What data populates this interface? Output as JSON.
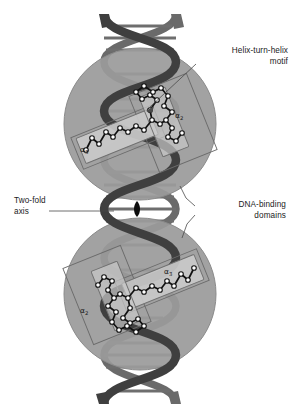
{
  "figure": {
    "background_color": "#ffffff",
    "width": 293,
    "height": 418
  },
  "palette": {
    "domain_circle_fill": "#9b9b9b",
    "domain_circle_stroke": "#8a8a8a",
    "dna_ribbon_fill": "#565656",
    "dna_ribbon_dark": "#3f3f3f",
    "dna_rung_fill": "#6e6e6e",
    "helix_box_fill": "#c9c9c9",
    "helix_box_stroke": "#707070",
    "domain_box_stroke": "#6b6b6b",
    "backbone_line": "#111111",
    "ca_atom_fill": "#ffffff",
    "ca_atom_stroke": "#111111",
    "axis_symbol_fill": "#0d0d0d",
    "label_text": "#1b1b1b",
    "leader_line": "#4a4a4a"
  },
  "labels": {
    "helix_turn_helix": "Helix-turn-helix\nmotif",
    "two_fold_axis": "Two-fold\naxis",
    "dna_binding_domains": "DNA-binding\ndomains"
  },
  "helix_labels": [
    {
      "id": "upper-alpha3",
      "text": "α",
      "subscript": "3",
      "x": 80,
      "y": 146
    },
    {
      "id": "upper-alpha2",
      "text": "α",
      "subscript": "2",
      "x": 175,
      "y": 112
    },
    {
      "id": "lower-alpha2",
      "text": "α",
      "subscript": "2",
      "x": 80,
      "y": 307
    },
    {
      "id": "lower-alpha3",
      "text": "α",
      "subscript": "3",
      "x": 164,
      "y": 268
    }
  ],
  "annotations": [
    {
      "name": "helix-turn-helix-leader",
      "from": {
        "x": 196,
        "y": 64
      },
      "to": {
        "x": 146,
        "y": 110
      },
      "arrow": true
    },
    {
      "name": "two-fold-axis-leader",
      "from": {
        "x": 49,
        "y": 211
      },
      "to": {
        "x": 112,
        "y": 211
      },
      "arrow": false
    },
    {
      "name": "dna-binding-domains-leader",
      "from": {
        "x": 195,
        "y": 206
      },
      "to": {
        "x": 178,
        "y": 188
      },
      "arrow": false
    },
    {
      "name": "dna-binding-domains-leader-lower",
      "from": {
        "x": 195,
        "y": 214
      },
      "to": {
        "x": 180,
        "y": 236
      },
      "arrow": false
    }
  ],
  "structure": {
    "dna": {
      "description": "Vertical B-form DNA double helix spanning the full figure height",
      "strand_count": 2,
      "axis_x": 140,
      "top_y": 14,
      "bottom_y": 404,
      "helical_period_px": 97,
      "base_pair_rungs": 22
    },
    "domains": [
      {
        "name": "upper-dna-binding-domain",
        "center": {
          "x": 140,
          "y": 124
        },
        "radius": 76,
        "helix_boxes": [
          {
            "label": "α3",
            "cx": 112,
            "cy": 135,
            "w": 74,
            "h": 26,
            "rotate": -22
          },
          {
            "label": "α2",
            "cx": 170,
            "cy": 118,
            "w": 52,
            "h": 70,
            "rotate": -30
          }
        ]
      },
      {
        "name": "lower-dna-binding-domain",
        "center": {
          "x": 140,
          "y": 294
        },
        "radius": 76,
        "helix_boxes": [
          {
            "label": "α3",
            "cx": 168,
            "cy": 283,
            "w": 74,
            "h": 26,
            "rotate": -22
          },
          {
            "label": "α2",
            "cx": 110,
            "cy": 300,
            "w": 52,
            "h": 70,
            "rotate": -30
          }
        ]
      }
    ],
    "two_fold_axis_symbol": {
      "shape": "pointed-oval",
      "x": 137,
      "y": 209,
      "width": 7,
      "height": 15
    }
  }
}
